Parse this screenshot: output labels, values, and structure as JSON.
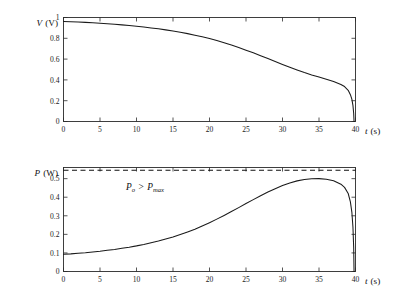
{
  "figure": {
    "panels": [
      {
        "id": "voltage-panel",
        "y_axis_label_symbol": "V",
        "y_axis_label_unit": "(V)",
        "x_axis_label_symbol": "t",
        "x_axis_label_unit": "(s)",
        "x_ticks": [
          0,
          5,
          10,
          15,
          20,
          25,
          30,
          35,
          40
        ],
        "x_ticklabels": [
          "0",
          "5",
          "10",
          "15",
          "20",
          "25",
          "30",
          "35",
          "40"
        ],
        "y_ticks": [
          0,
          0.2,
          0.4,
          0.6,
          0.8,
          1
        ],
        "y_ticklabels": [
          "0",
          "0.2",
          "0.4",
          "0.6",
          "0.8",
          "1"
        ]
      },
      {
        "id": "power-panel",
        "y_axis_label_symbol": "P",
        "y_axis_label_unit": "(W)",
        "x_axis_label_symbol": "t",
        "x_axis_label_unit": "(s)",
        "x_ticks": [
          0,
          5,
          10,
          15,
          20,
          25,
          30,
          35,
          40
        ],
        "x_ticklabels": [
          "0",
          "5",
          "10",
          "15",
          "20",
          "25",
          "30",
          "35",
          "40"
        ],
        "y_ticks": [
          0,
          0.1,
          0.2,
          0.3,
          0.4,
          0.5
        ],
        "y_ticklabels": [
          "0",
          "0.1",
          "0.2",
          "0.3",
          "0.4",
          "0.5"
        ],
        "annotation": {
          "symbol_1": "P",
          "sub_1": "o",
          "operator": ">",
          "symbol_2": "P",
          "sub_2": "max",
          "text": "Po > Pmax"
        }
      }
    ]
  },
  "chart_data": [
    {
      "type": "line",
      "id": "voltage-vs-time",
      "title": "",
      "xlabel": "t (s)",
      "ylabel": "V (V)",
      "xlim": [
        0,
        40
      ],
      "ylim": [
        0,
        1
      ],
      "grid": false,
      "legend": null,
      "series": [
        {
          "name": "V(t)",
          "style": "solid",
          "color": "#1a1a1a",
          "x": [
            0,
            1,
            2,
            3,
            4,
            5,
            6,
            7,
            8,
            9,
            10,
            11,
            12,
            13,
            14,
            15,
            16,
            17,
            18,
            19,
            20,
            21,
            22,
            23,
            24,
            25,
            26,
            27,
            28,
            29,
            30,
            31,
            32,
            33,
            34,
            35,
            36,
            37,
            38,
            38.5,
            39,
            39.3,
            39.5,
            39.65,
            39.75,
            39.8
          ],
          "y": [
            0.962,
            0.959,
            0.956,
            0.953,
            0.949,
            0.945,
            0.94,
            0.935,
            0.929,
            0.923,
            0.916,
            0.908,
            0.9,
            0.891,
            0.881,
            0.87,
            0.858,
            0.845,
            0.83,
            0.814,
            0.797,
            0.778,
            0.757,
            0.735,
            0.711,
            0.686,
            0.66,
            0.633,
            0.605,
            0.577,
            0.549,
            0.522,
            0.496,
            0.471,
            0.448,
            0.427,
            0.406,
            0.384,
            0.356,
            0.336,
            0.3,
            0.258,
            0.215,
            0.155,
            0.08,
            0.0
          ]
        }
      ]
    },
    {
      "type": "line",
      "id": "power-vs-time",
      "title": "",
      "xlabel": "t (s)",
      "ylabel": "P (W)",
      "xlim": [
        0,
        40
      ],
      "ylim": [
        0,
        0.56
      ],
      "grid": false,
      "legend": null,
      "annotations": [
        {
          "text": "Po > Pmax",
          "x": 12.5,
          "y": 0.505
        }
      ],
      "reference_lines": [
        {
          "name": "Pmax",
          "orientation": "horizontal",
          "value": 0.545,
          "style": "dashed",
          "color": "#111111"
        }
      ],
      "series": [
        {
          "name": "P(t)",
          "style": "solid",
          "color": "#1a1a1a",
          "x": [
            0,
            1,
            2,
            3,
            4,
            5,
            6,
            7,
            8,
            9,
            10,
            11,
            12,
            13,
            14,
            15,
            16,
            17,
            18,
            19,
            20,
            21,
            22,
            23,
            24,
            25,
            26,
            27,
            28,
            29,
            30,
            31,
            32,
            33,
            34,
            35,
            36,
            37,
            38,
            38.5,
            39,
            39.3,
            39.5,
            39.65,
            39.75,
            39.8
          ],
          "y": [
            0.093,
            0.095,
            0.098,
            0.101,
            0.105,
            0.109,
            0.114,
            0.119,
            0.125,
            0.131,
            0.138,
            0.146,
            0.155,
            0.164,
            0.175,
            0.186,
            0.199,
            0.213,
            0.228,
            0.245,
            0.263,
            0.282,
            0.302,
            0.323,
            0.344,
            0.366,
            0.387,
            0.408,
            0.428,
            0.446,
            0.463,
            0.477,
            0.488,
            0.495,
            0.499,
            0.5,
            0.497,
            0.489,
            0.47,
            0.453,
            0.42,
            0.375,
            0.32,
            0.24,
            0.13,
            0.0
          ]
        }
      ]
    }
  ]
}
